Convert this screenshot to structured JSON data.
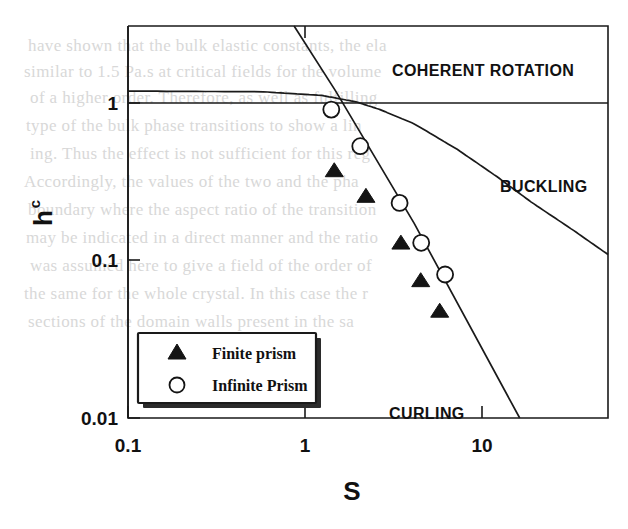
{
  "figure": {
    "axes": {
      "x": {
        "label": "S",
        "scale": "log",
        "min": 0.1,
        "max": 30,
        "ticks": [
          {
            "value": 0.1,
            "label": "0.1"
          },
          {
            "value": 1,
            "label": "1"
          },
          {
            "value": 10,
            "label": "10"
          }
        ]
      },
      "y": {
        "label": "h",
        "label_sub": "c",
        "scale": "log",
        "min": 0.01,
        "max": 2.5,
        "ticks": [
          {
            "value": 1,
            "label": "1"
          },
          {
            "value": 0.1,
            "label": "0.1"
          },
          {
            "value": 0.01,
            "label": "0.01"
          }
        ]
      }
    },
    "region_labels": [
      {
        "name": "coherent-rotation",
        "text": "COHERENT ROTATION"
      },
      {
        "name": "buckling",
        "text": "BUCKLING"
      },
      {
        "name": "curling",
        "text": "CURLING"
      }
    ],
    "legend": {
      "entries": [
        {
          "marker": "filled-triangle-icon",
          "label": "Finite prism"
        },
        {
          "marker": "open-circle-icon",
          "label": "Infinite Prism"
        }
      ]
    }
  },
  "chart_data": {
    "type": "scatter",
    "title": "",
    "xlabel": "S",
    "ylabel": "h_c",
    "xscale": "log",
    "yscale": "log",
    "xlim": [
      0.1,
      30
    ],
    "ylim": [
      0.01,
      2.5
    ],
    "grid": false,
    "legend_position": "lower-left-inside",
    "annotations": [
      {
        "text": "COHERENT ROTATION",
        "x": 12.5,
        "y": 1.55
      },
      {
        "text": "BUCKLING",
        "x": 21.0,
        "y": 0.33
      },
      {
        "text": "CURLING",
        "x": 7.3,
        "y": 0.0135
      }
    ],
    "series": [
      {
        "name": "Finite prism",
        "marker": "filled-triangle",
        "x": [
          1.16,
          1.69,
          2.56,
          3.24,
          4.06
        ],
        "y": [
          0.327,
          0.228,
          0.118,
          0.0695,
          0.0452
        ]
      },
      {
        "name": "Infinite Prism",
        "marker": "open-circle",
        "x": [
          1.12,
          1.58,
          2.52,
          3.26,
          4.33
        ],
        "y": [
          0.77,
          0.46,
          0.207,
          0.118,
          0.0755
        ]
      }
    ],
    "curves": [
      {
        "name": "coherent-rotation-boundary",
        "description": "horizontal asymptote at h_c = 1 left of crossover",
        "points": [
          [
            0.1,
            1.0
          ],
          [
            30,
            1.0
          ]
        ]
      },
      {
        "name": "buckling-boundary",
        "description": "buckling nucleation field, falls from 1 toward 0.1 at large S",
        "points": [
          [
            0.1,
            1.0
          ],
          [
            0.5,
            0.99
          ],
          [
            1.0,
            0.94
          ],
          [
            1.5,
            0.86
          ],
          [
            2.0,
            0.77
          ],
          [
            3.0,
            0.63
          ],
          [
            5.0,
            0.44
          ],
          [
            8.0,
            0.3
          ],
          [
            12.0,
            0.21
          ],
          [
            20.0,
            0.14
          ],
          [
            30.0,
            0.1
          ]
        ]
      },
      {
        "name": "curling-boundary",
        "description": "curling nucleation field ~ 1/S^2, steep descending line",
        "points": [
          [
            0.72,
            2.5
          ],
          [
            1.18,
            1.0
          ],
          [
            3.0,
            0.155
          ],
          [
            10.5,
            0.01
          ]
        ]
      }
    ]
  },
  "bleed_through_text": [
    "have shown that the bulk elastic constants, the ela",
    "similar to 1.5 Pa.s at critical fields for the volume",
    "of a higher order. Therefore, as well as fulfilling",
    "type of the bulk phase transitions to show a lin",
    "ing. Thus the effect is not sufficient for this reg",
    "Accordingly, the values of the two and the pha",
    "boundary where the aspect ratio of the transition",
    "may be indicated in a direct manner and the ratio",
    "was assumed here to give a field of the order of",
    "the same for the whole crystal. In this case the r",
    "sections of the domain walls present in the sa"
  ]
}
